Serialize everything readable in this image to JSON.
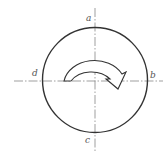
{
  "diagram": {
    "type": "rotation-direction-circle",
    "labels": {
      "top": "a",
      "right": "b",
      "bottom": "c",
      "left": "d"
    },
    "rotation": "clockwise",
    "colors": {
      "stroke": "#333333",
      "axis": "#666666",
      "label": "#555555",
      "background": "#ffffff"
    }
  }
}
